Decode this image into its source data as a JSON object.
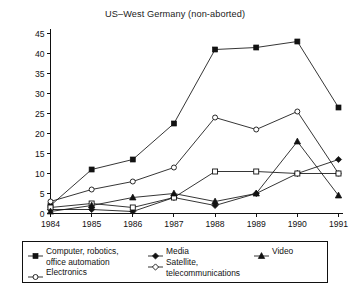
{
  "chart_data": {
    "type": "line",
    "title": "US–West Germany (non-aborted)",
    "xlabel": "",
    "ylabel": "",
    "x": [
      1984,
      1985,
      1986,
      1987,
      1988,
      1989,
      1990,
      1991
    ],
    "categories": [
      "1984",
      "1985",
      "1986",
      "1987",
      "1988",
      "1989",
      "1990",
      "1991"
    ],
    "xlim": [
      1984,
      1991
    ],
    "ylim": [
      0,
      45
    ],
    "ytick_labels": [
      "0",
      "5",
      "10",
      "15",
      "20",
      "25",
      "30",
      "35",
      "40",
      "45"
    ],
    "ytick_values": [
      0,
      5,
      10,
      15,
      20,
      25,
      30,
      35,
      40,
      45
    ],
    "grid": false,
    "legend_position": "below-plot",
    "series": [
      {
        "name": "Computer, robotics,\noffice automation",
        "marker": "filled-square",
        "values": [
          2,
          11,
          13.5,
          22.5,
          41,
          41.5,
          43,
          26.5
        ]
      },
      {
        "name": "Electronics",
        "marker": "open-circle",
        "values": [
          3,
          6,
          8,
          11.5,
          24,
          21,
          25.5,
          10
        ]
      },
      {
        "name": "Media",
        "marker": "filled-diamond",
        "values": [
          1,
          1,
          0.5,
          4,
          2,
          5,
          10,
          13.5
        ]
      },
      {
        "name": "Satellite,\ntelecommunications",
        "marker": "open-square",
        "values": [
          1.5,
          2.5,
          1.5,
          4,
          10.5,
          10.5,
          10,
          10
        ]
      },
      {
        "name": "Video",
        "marker": "filled-triangle",
        "values": [
          0.5,
          2,
          4,
          5,
          3,
          5,
          18,
          4.5
        ]
      }
    ]
  },
  "legend": {
    "columns": [
      [
        {
          "label": "Computer, robotics,\noffice automation",
          "marker": "filled-square"
        },
        {
          "label": "Electronics",
          "marker": "open-circle"
        }
      ],
      [
        {
          "label": "Media",
          "marker": "filled-diamond"
        },
        {
          "label": "Satellite,\ntelecommunications",
          "marker": "open-diamond"
        }
      ],
      [
        {
          "label": "Video",
          "marker": "filled-triangle"
        }
      ]
    ]
  },
  "colors": {
    "ink": "#121212",
    "background": "#ffffff"
  }
}
